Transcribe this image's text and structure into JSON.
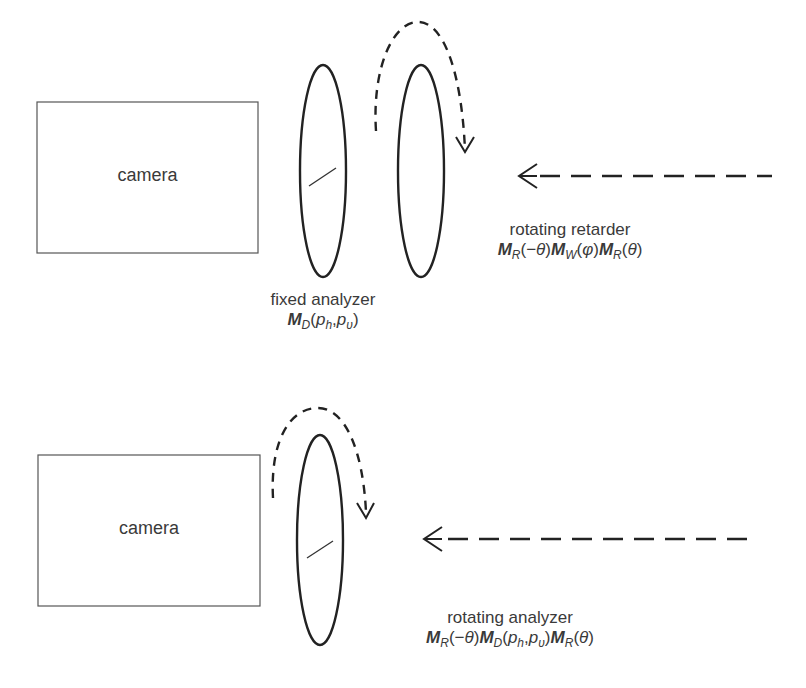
{
  "top_setup": {
    "camera_label": "camera",
    "fixed_analyzer": {
      "label": "fixed analyzer",
      "formula": "M_D(p_h, p_v)"
    },
    "rotating_retarder": {
      "label": "rotating retarder",
      "formula": "M_R(−θ) M_W(φ) M_R(θ)"
    }
  },
  "bottom_setup": {
    "camera_label": "camera",
    "rotating_analyzer": {
      "label": "rotating analyzer",
      "formula": "M_R(−θ) M_D(p_h, p_v) M_R(θ)"
    }
  },
  "colors": {
    "stroke": "#222222",
    "box_stroke": "#555555",
    "text": "#3a3a3a"
  }
}
